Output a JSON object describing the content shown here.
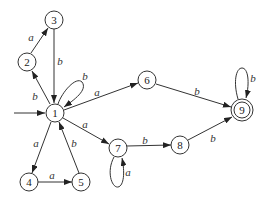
{
  "diagram": {
    "type": "finite-automaton",
    "start_state": "1",
    "accept_states": [
      "9"
    ],
    "nodes": [
      {
        "id": "1",
        "label": "1",
        "x": 55,
        "y": 113
      },
      {
        "id": "2",
        "label": "2",
        "x": 27,
        "y": 62
      },
      {
        "id": "3",
        "label": "3",
        "x": 54,
        "y": 20
      },
      {
        "id": "4",
        "label": "4",
        "x": 29,
        "y": 182
      },
      {
        "id": "5",
        "label": "5",
        "x": 81,
        "y": 182
      },
      {
        "id": "6",
        "label": "6",
        "x": 147,
        "y": 80
      },
      {
        "id": "7",
        "label": "7",
        "x": 118,
        "y": 148
      },
      {
        "id": "8",
        "label": "8",
        "x": 180,
        "y": 145
      },
      {
        "id": "9",
        "label": "9",
        "x": 242,
        "y": 110
      }
    ],
    "edges": [
      {
        "from": "1",
        "to": "2",
        "label": "b"
      },
      {
        "from": "2",
        "to": "3",
        "label": "a"
      },
      {
        "from": "3",
        "to": "1",
        "label": "b"
      },
      {
        "from": "1",
        "to": "1",
        "label": "b"
      },
      {
        "from": "1",
        "to": "6",
        "label": "a"
      },
      {
        "from": "1",
        "to": "7",
        "label": "a"
      },
      {
        "from": "1",
        "to": "4",
        "label": "a"
      },
      {
        "from": "4",
        "to": "5",
        "label": "a"
      },
      {
        "from": "5",
        "to": "1",
        "label": "b"
      },
      {
        "from": "7",
        "to": "7",
        "label": "a"
      },
      {
        "from": "7",
        "to": "8",
        "label": "b"
      },
      {
        "from": "8",
        "to": "9",
        "label": "b"
      },
      {
        "from": "6",
        "to": "9",
        "label": "b"
      },
      {
        "from": "9",
        "to": "9",
        "label": "b"
      }
    ]
  }
}
